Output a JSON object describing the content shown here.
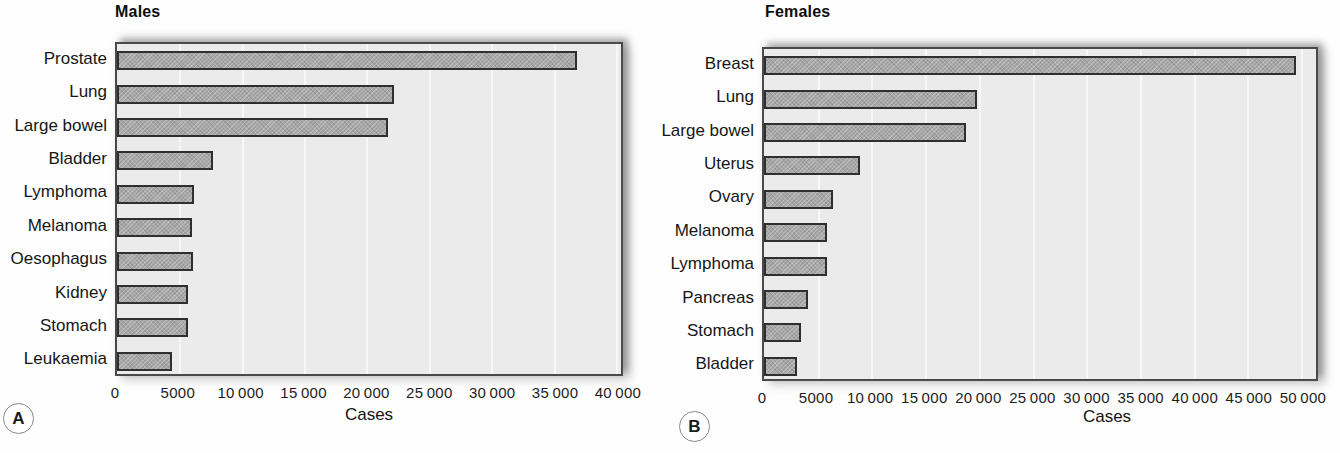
{
  "page": {
    "background": "#fefefe"
  },
  "colors": {
    "bar_fill": "#a8a8a8",
    "bar_border": "#2f2f2f",
    "plot_bg": "#ebebeb",
    "plot_border": "#4a4a4a",
    "gridline": "#f7f7f7"
  },
  "chart_data": [
    {
      "type": "bar",
      "orientation": "horizontal",
      "panel_label": "A",
      "title": "Males",
      "xlabel": "Cases",
      "categories": [
        "Prostate",
        "Lung",
        "Large bowel",
        "Bladder",
        "Lymphoma",
        "Melanoma",
        "Oesophagus",
        "Kidney",
        "Stomach",
        "Leukaemia"
      ],
      "values": [
        36900,
        22200,
        21700,
        7700,
        6200,
        6000,
        6100,
        5700,
        5700,
        4400
      ],
      "xlim": [
        0,
        40000
      ],
      "xticks": [
        0,
        5000,
        10000,
        15000,
        20000,
        25000,
        30000,
        35000,
        40000
      ],
      "xtick_labels": [
        "0",
        "5000",
        "10 000",
        "15 000",
        "20 000",
        "25 000",
        "30 000",
        "35 000",
        "40 000"
      ],
      "grid": "vertical-light",
      "legend": "none"
    },
    {
      "type": "bar",
      "orientation": "horizontal",
      "panel_label": "B",
      "title": "Females",
      "xlabel": "Cases",
      "categories": [
        "Breast",
        "Lung",
        "Large bowel",
        "Uterus",
        "Ovary",
        "Melanoma",
        "Lymphoma",
        "Pancreas",
        "Stomach",
        "Bladder"
      ],
      "values": [
        49500,
        19800,
        18800,
        8900,
        6400,
        5900,
        5900,
        4100,
        3400,
        3100
      ],
      "xlim": [
        0,
        50000
      ],
      "xticks": [
        0,
        5000,
        10000,
        15000,
        20000,
        25000,
        30000,
        35000,
        40000,
        45000,
        50000
      ],
      "xtick_labels": [
        "0",
        "5000",
        "10 000",
        "15 000",
        "20 000",
        "25 000",
        "30 000",
        "35 000",
        "40 000",
        "45 000",
        "50 000"
      ],
      "grid": "vertical-light",
      "legend": "none"
    }
  ]
}
